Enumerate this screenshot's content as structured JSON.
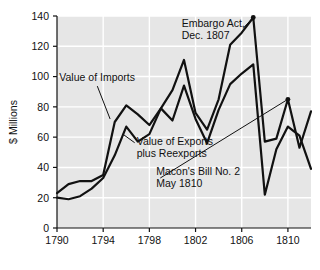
{
  "chart_data": {
    "type": "line",
    "title": "",
    "subtitle": "",
    "xlabel": "",
    "ylabel": "$ Millions",
    "xlim": [
      1790,
      1812
    ],
    "ylim": [
      0,
      140
    ],
    "grid": true,
    "grid_color": "#ffffff",
    "plot_background": "#e6e6e6",
    "legend_position": "none",
    "line_color": "#111111",
    "xticks": [
      1790,
      1794,
      1798,
      1802,
      1806,
      1810
    ],
    "xticklabels": [
      "1790",
      "1794",
      "1798",
      "1802",
      "1806",
      "1810"
    ],
    "yticks": [
      0,
      20,
      40,
      60,
      80,
      100,
      120,
      140
    ],
    "yticklabels": [
      "0",
      "20",
      "40",
      "60",
      "80",
      "100",
      "120",
      "140"
    ],
    "x": [
      1790,
      1791,
      1792,
      1793,
      1794,
      1795,
      1796,
      1797,
      1798,
      1799,
      1800,
      1801,
      1802,
      1803,
      1804,
      1805,
      1806,
      1807,
      1808,
      1809,
      1810,
      1811,
      1812
    ],
    "series": [
      {
        "name": "Value of Imports",
        "values": [
          23,
          29,
          31,
          31,
          35,
          70,
          81,
          75,
          68,
          79,
          91,
          111,
          76,
          65,
          85,
          121,
          129,
          139,
          57,
          59,
          85,
          53,
          77
        ]
      },
      {
        "name": "Value of Exports plus Reexports",
        "values": [
          20,
          19,
          21,
          26,
          33,
          48,
          67,
          57,
          62,
          79,
          71,
          94,
          72,
          56,
          78,
          95,
          102,
          108,
          22,
          52,
          67,
          61,
          39
        ]
      }
    ],
    "annotations": [
      {
        "id": "embargo-act",
        "lines": [
          "Embargo Act,",
          "Dec. 1807"
        ],
        "text_x": 1800.8,
        "text_y": 133,
        "point_x": 1807,
        "point_y": 139
      },
      {
        "id": "value-of-imports",
        "lines": [
          "Value of Imports"
        ],
        "text_x": 1790.2,
        "text_y": 97,
        "point_x": 1794.6,
        "point_y": 72
      },
      {
        "id": "value-of-exports-plus-reexports",
        "lines": [
          "Value of Exports",
          "plus Reexports"
        ],
        "text_x": 1796.9,
        "text_y": 55,
        "point_x": 1795.7,
        "point_y": 62
      },
      {
        "id": "macons-bill-no-2",
        "lines": [
          "Macon's Bill No. 2",
          "May 1810"
        ],
        "text_x": 1798.6,
        "text_y": 35,
        "point_x": 1810,
        "point_y": 85
      }
    ]
  }
}
